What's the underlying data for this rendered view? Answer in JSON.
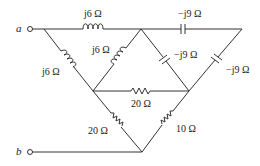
{
  "diagram": {
    "type": "circuit",
    "terminals": [
      {
        "id": "a",
        "label": "a"
      },
      {
        "id": "b",
        "label": "b"
      }
    ],
    "components": [
      {
        "id": "L_top",
        "kind": "inductor",
        "label": "j6 Ω",
        "between": [
          "top-left",
          "top-middle"
        ]
      },
      {
        "id": "L_left",
        "kind": "inductor",
        "label": "j6 Ω",
        "between": [
          "top-left",
          "middle-left"
        ]
      },
      {
        "id": "L_mid",
        "kind": "inductor",
        "label": "j6 Ω",
        "between": [
          "top-middle",
          "middle-left"
        ]
      },
      {
        "id": "C_top",
        "kind": "capacitor",
        "label": "−j9 Ω",
        "between": [
          "top-middle",
          "top-right"
        ]
      },
      {
        "id": "C_mid",
        "kind": "capacitor",
        "label": "−j9 Ω",
        "between": [
          "top-middle",
          "middle-right"
        ]
      },
      {
        "id": "C_right",
        "kind": "capacitor",
        "label": "−j9 Ω",
        "between": [
          "top-right",
          "middle-right"
        ]
      },
      {
        "id": "R_mid",
        "kind": "resistor",
        "label": "20 Ω",
        "between": [
          "middle-left",
          "middle-right"
        ]
      },
      {
        "id": "R_left",
        "kind": "resistor",
        "label": "20 Ω",
        "between": [
          "middle-left",
          "bottom"
        ]
      },
      {
        "id": "R_right",
        "kind": "resistor",
        "label": "10 Ω",
        "between": [
          "middle-right",
          "bottom"
        ]
      }
    ]
  }
}
